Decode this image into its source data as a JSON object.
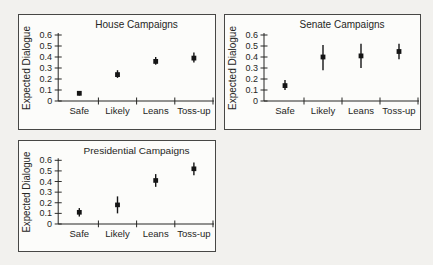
{
  "figure": {
    "background": "#f2f1ee",
    "panel_background": "#fcfcfa",
    "panel_border_color": "#474745",
    "ink": "#262624",
    "marker_color": "#151515"
  },
  "chart_data": [
    {
      "type": "scatter",
      "title": "House Campaigns",
      "xlabel": "",
      "ylabel": "Expected Dialogue",
      "categories": [
        "Safe",
        "Likely",
        "Leans",
        "Toss-up"
      ],
      "ylim": [
        0,
        0.6
      ],
      "yticks": [
        0,
        0.1,
        0.2,
        0.3,
        0.4,
        0.5,
        0.6
      ],
      "ytick_labels": [
        "0",
        "0.1",
        "0.2",
        "0.3",
        "0.4",
        "0.5",
        "0.6"
      ],
      "grid": false,
      "legend": "none",
      "marker": "filled-square-with-error-bar",
      "series": [
        {
          "name": "expected dialogue estimate",
          "values": [
            0.07,
            0.24,
            0.36,
            0.39
          ],
          "ci_low": [
            0.05,
            0.21,
            0.33,
            0.35
          ],
          "ci_high": [
            0.09,
            0.28,
            0.4,
            0.44
          ]
        }
      ]
    },
    {
      "type": "scatter",
      "title": "Senate Campaigns",
      "xlabel": "",
      "ylabel": "Expected Dialogue",
      "categories": [
        "Safe",
        "Likely",
        "Leans",
        "Toss-up"
      ],
      "ylim": [
        0,
        0.6
      ],
      "yticks": [
        0,
        0.1,
        0.2,
        0.3,
        0.4,
        0.5,
        0.6
      ],
      "ytick_labels": [
        "0",
        "0.1",
        "0.2",
        "0.3",
        "0.4",
        "0.5",
        "0.6"
      ],
      "grid": false,
      "legend": "none",
      "marker": "filled-square-with-error-bar",
      "series": [
        {
          "name": "expected dialogue estimate",
          "values": [
            0.14,
            0.4,
            0.41,
            0.45
          ],
          "ci_low": [
            0.1,
            0.28,
            0.3,
            0.38
          ],
          "ci_high": [
            0.19,
            0.51,
            0.52,
            0.52
          ]
        }
      ]
    },
    {
      "type": "scatter",
      "title": "Presidential Campaigns",
      "xlabel": "",
      "ylabel": "Expected Dialogue",
      "categories": [
        "Safe",
        "Likely",
        "Leans",
        "Toss-up"
      ],
      "ylim": [
        0,
        0.6
      ],
      "yticks": [
        0,
        0.1,
        0.2,
        0.3,
        0.4,
        0.5,
        0.6
      ],
      "ytick_labels": [
        "0",
        "0.1",
        "0.2",
        "0.3",
        "0.4",
        "0.5",
        "0.6"
      ],
      "grid": false,
      "legend": "none",
      "marker": "filled-square-with-error-bar",
      "series": [
        {
          "name": "expected dialogue estimate",
          "values": [
            0.11,
            0.18,
            0.41,
            0.52
          ],
          "ci_low": [
            0.07,
            0.1,
            0.35,
            0.46
          ],
          "ci_high": [
            0.15,
            0.26,
            0.47,
            0.58
          ]
        }
      ]
    }
  ]
}
